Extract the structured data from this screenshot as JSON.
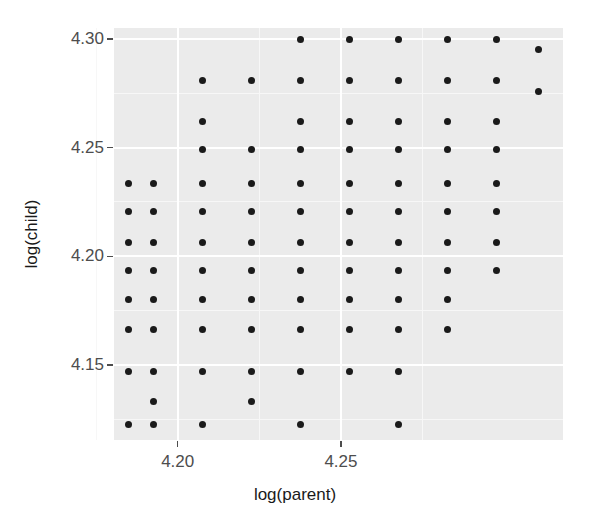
{
  "figure": {
    "background_color": "#ffffff",
    "panel_background_color": "#ebebeb",
    "gridline_color": "#ffffff",
    "point_color": "#1a1a1a",
    "axis_text_color": "#4d4d4d",
    "title_color": "#1a1a1a"
  },
  "axes": {
    "x_title": "log(parent)",
    "y_title": "log(child)",
    "x_ticks": [
      {
        "label": "4.20",
        "value": 4.2
      },
      {
        "label": "4.25",
        "value": 4.25
      }
    ],
    "y_ticks": [
      {
        "label": "4.30",
        "value": 4.3
      },
      {
        "label": "4.25",
        "value": 4.25
      },
      {
        "label": "4.20",
        "value": 4.2
      },
      {
        "label": "4.15",
        "value": 4.15
      }
    ]
  },
  "chart_data": {
    "type": "scatter",
    "title": "",
    "subtitle": "",
    "xlabel": "log(parent)",
    "ylabel": "log(child)",
    "xlim": [
      4.1805,
      4.2678
    ],
    "ylim": [
      4.1172,
      4.3033
    ],
    "xticks": [
      4.2,
      4.25
    ],
    "yticks": [
      4.15,
      4.2,
      4.25,
      4.3
    ],
    "xticklabels": [
      "4.20",
      "4.25"
    ],
    "yticklabels": [
      "4.15",
      "4.20",
      "4.25",
      "4.30"
    ],
    "grid": true,
    "legend": null,
    "annotations": [],
    "marker": {
      "shape": "circle",
      "color": "#1a1a1a",
      "size": 7
    },
    "note": "Discretized grid of (log parent height, log child height) pairs; Galton-style heredity data plotted on log scale.",
    "x_levels": [
      4.185,
      4.1925,
      4.2075,
      4.2225,
      4.2375,
      4.2525,
      4.2675,
      4.2825,
      4.2975,
      4.3105
    ],
    "y_levels": [
      4.1218,
      4.13,
      4.1382,
      4.1464,
      4.1546,
      4.1628,
      4.171,
      4.1792,
      4.1874,
      4.1956,
      4.2038,
      4.212,
      4.2202,
      4.2284,
      4.2366
    ],
    "points": [
      {
        "x": 4.185,
        "y": 4.2335
      },
      {
        "x": 4.185,
        "y": 4.2205
      },
      {
        "x": 4.185,
        "y": 4.2065
      },
      {
        "x": 4.185,
        "y": 4.1935
      },
      {
        "x": 4.185,
        "y": 4.18
      },
      {
        "x": 4.185,
        "y": 4.1665
      },
      {
        "x": 4.185,
        "y": 4.147
      },
      {
        "x": 4.185,
        "y": 4.1225
      },
      {
        "x": 4.1925,
        "y": 4.2335
      },
      {
        "x": 4.1925,
        "y": 4.2205
      },
      {
        "x": 4.1925,
        "y": 4.2065
      },
      {
        "x": 4.1925,
        "y": 4.1935
      },
      {
        "x": 4.1925,
        "y": 4.18
      },
      {
        "x": 4.1925,
        "y": 4.1665
      },
      {
        "x": 4.1925,
        "y": 4.147
      },
      {
        "x": 4.1925,
        "y": 4.133
      },
      {
        "x": 4.1925,
        "y": 4.1225
      },
      {
        "x": 4.2075,
        "y": 4.281
      },
      {
        "x": 4.2075,
        "y": 4.262
      },
      {
        "x": 4.2075,
        "y": 4.249
      },
      {
        "x": 4.2075,
        "y": 4.2335
      },
      {
        "x": 4.2075,
        "y": 4.2205
      },
      {
        "x": 4.2075,
        "y": 4.2065
      },
      {
        "x": 4.2075,
        "y": 4.1935
      },
      {
        "x": 4.2075,
        "y": 4.18
      },
      {
        "x": 4.2075,
        "y": 4.1665
      },
      {
        "x": 4.2075,
        "y": 4.147
      },
      {
        "x": 4.2075,
        "y": 4.1225
      },
      {
        "x": 4.2225,
        "y": 4.281
      },
      {
        "x": 4.2225,
        "y": 4.249
      },
      {
        "x": 4.2225,
        "y": 4.2335
      },
      {
        "x": 4.2225,
        "y": 4.2205
      },
      {
        "x": 4.2225,
        "y": 4.2065
      },
      {
        "x": 4.2225,
        "y": 4.1935
      },
      {
        "x": 4.2225,
        "y": 4.18
      },
      {
        "x": 4.2225,
        "y": 4.1665
      },
      {
        "x": 4.2225,
        "y": 4.147
      },
      {
        "x": 4.2225,
        "y": 4.133
      },
      {
        "x": 4.2375,
        "y": 4.2995
      },
      {
        "x": 4.2375,
        "y": 4.281
      },
      {
        "x": 4.2375,
        "y": 4.262
      },
      {
        "x": 4.2375,
        "y": 4.249
      },
      {
        "x": 4.2375,
        "y": 4.2335
      },
      {
        "x": 4.2375,
        "y": 4.2205
      },
      {
        "x": 4.2375,
        "y": 4.2065
      },
      {
        "x": 4.2375,
        "y": 4.1935
      },
      {
        "x": 4.2375,
        "y": 4.18
      },
      {
        "x": 4.2375,
        "y": 4.1665
      },
      {
        "x": 4.2375,
        "y": 4.147
      },
      {
        "x": 4.2375,
        "y": 4.1225
      },
      {
        "x": 4.2525,
        "y": 4.2995
      },
      {
        "x": 4.2525,
        "y": 4.281
      },
      {
        "x": 4.2525,
        "y": 4.262
      },
      {
        "x": 4.2525,
        "y": 4.249
      },
      {
        "x": 4.2525,
        "y": 4.2335
      },
      {
        "x": 4.2525,
        "y": 4.2205
      },
      {
        "x": 4.2525,
        "y": 4.2065
      },
      {
        "x": 4.2525,
        "y": 4.1935
      },
      {
        "x": 4.2525,
        "y": 4.18
      },
      {
        "x": 4.2525,
        "y": 4.1665
      },
      {
        "x": 4.2525,
        "y": 4.147
      },
      {
        "x": 4.2675,
        "y": 4.2995
      },
      {
        "x": 4.2675,
        "y": 4.281
      },
      {
        "x": 4.2675,
        "y": 4.262
      },
      {
        "x": 4.2675,
        "y": 4.249
      },
      {
        "x": 4.2675,
        "y": 4.2335
      },
      {
        "x": 4.2675,
        "y": 4.2205
      },
      {
        "x": 4.2675,
        "y": 4.2065
      },
      {
        "x": 4.2675,
        "y": 4.1935
      },
      {
        "x": 4.2675,
        "y": 4.18
      },
      {
        "x": 4.2675,
        "y": 4.1665
      },
      {
        "x": 4.2675,
        "y": 4.147
      },
      {
        "x": 4.2675,
        "y": 4.1225
      },
      {
        "x": 4.2825,
        "y": 4.2995
      },
      {
        "x": 4.2825,
        "y": 4.281
      },
      {
        "x": 4.2825,
        "y": 4.262
      },
      {
        "x": 4.2825,
        "y": 4.249
      },
      {
        "x": 4.2825,
        "y": 4.2335
      },
      {
        "x": 4.2825,
        "y": 4.2205
      },
      {
        "x": 4.2825,
        "y": 4.2065
      },
      {
        "x": 4.2825,
        "y": 4.1935
      },
      {
        "x": 4.2825,
        "y": 4.18
      },
      {
        "x": 4.2825,
        "y": 4.1665
      },
      {
        "x": 4.2975,
        "y": 4.2995
      },
      {
        "x": 4.2975,
        "y": 4.281
      },
      {
        "x": 4.2975,
        "y": 4.262
      },
      {
        "x": 4.2975,
        "y": 4.249
      },
      {
        "x": 4.2975,
        "y": 4.2335
      },
      {
        "x": 4.2975,
        "y": 4.2205
      },
      {
        "x": 4.2975,
        "y": 4.2065
      },
      {
        "x": 4.2975,
        "y": 4.1935
      },
      {
        "x": 4.3105,
        "y": 4.295
      },
      {
        "x": 4.3105,
        "y": 4.276
      }
    ]
  },
  "geometry": {
    "panel": {
      "left": 114,
      "top": 28,
      "width": 449,
      "height": 412
    },
    "x_scale": {
      "min": 4.1805,
      "max": 4.318
    },
    "y_scale": {
      "min": 4.1155,
      "max": 4.305
    },
    "major_gridlines_x": [
      4.2,
      4.25
    ],
    "major_gridlines_y": [
      4.15,
      4.2,
      4.25,
      4.3
    ],
    "minor_gridlines_x": [
      4.175,
      4.225,
      4.275
    ],
    "minor_gridlines_y": [
      4.125,
      4.175,
      4.225,
      4.275
    ]
  }
}
